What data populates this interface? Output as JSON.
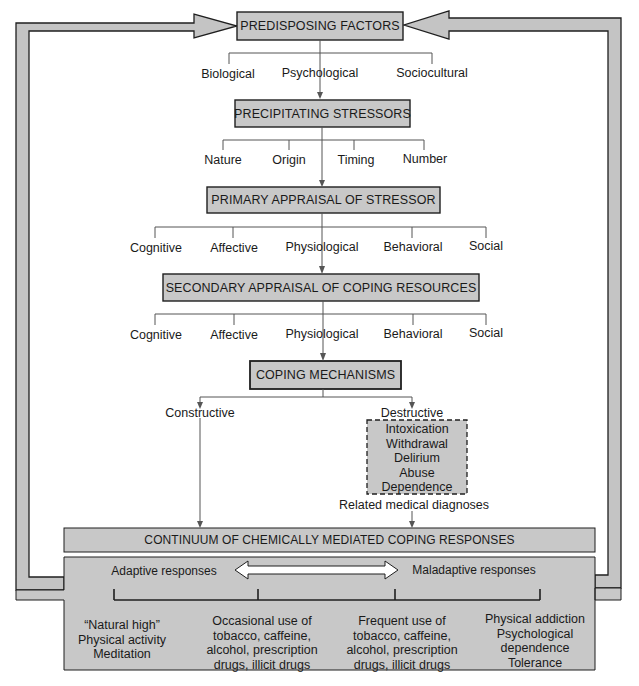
{
  "colors": {
    "box_fill": "#c8c8c8",
    "loop_fill": "#c4c4c4",
    "stroke": "#1f1f1f",
    "connector": "#555555",
    "background": "#ffffff"
  },
  "nodes": {
    "predisposing": {
      "title": "PREDISPOSING FACTORS",
      "children": [
        "Biological",
        "Psychological",
        "Sociocultural"
      ]
    },
    "precipitating": {
      "title": "PRECIPITATING STRESSORS",
      "children": [
        "Nature",
        "Origin",
        "Timing",
        "Number"
      ]
    },
    "primary": {
      "title": "PRIMARY APPRAISAL OF STRESSOR",
      "children": [
        "Cognitive",
        "Affective",
        "Physiological",
        "Behavioral",
        "Social"
      ]
    },
    "secondary": {
      "title": "SECONDARY APPRAISAL OF COPING RESOURCES",
      "children": [
        "Cognitive",
        "Affective",
        "Physiological",
        "Behavioral",
        "Social"
      ]
    },
    "coping": {
      "title": "COPING MECHANISMS",
      "constructive": "Constructive",
      "destructive": "Destructive",
      "destructive_items": [
        "Intoxication",
        "Withdrawal",
        "Delirium",
        "Abuse",
        "Dependence"
      ],
      "related": "Related medical diagnoses"
    },
    "continuum": {
      "title": "CONTINUUM OF CHEMICALLY MEDIATED COPING RESPONSES",
      "adaptive": "Adaptive responses",
      "maladaptive": "Maladaptive responses",
      "points": [
        [
          "“Natural high”",
          "Physical activity",
          "Meditation"
        ],
        [
          "Occasional use of",
          "tobacco, caffeine,",
          "alcohol, prescription",
          "drugs, illicit drugs"
        ],
        [
          "Frequent use of",
          "tobacco, caffeine,",
          "alcohol, prescription",
          "drugs, illicit drugs"
        ],
        [
          "Physical addiction",
          "Psychological",
          "dependence",
          "Tolerance"
        ]
      ]
    }
  }
}
